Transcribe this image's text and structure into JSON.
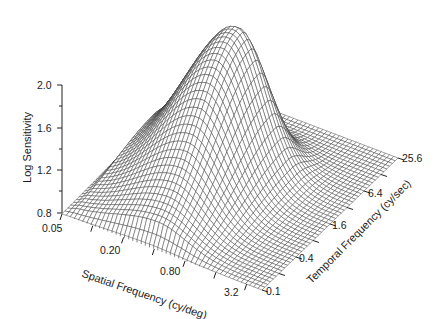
{
  "chart_data": {
    "type": "surface3d",
    "title": "",
    "zlabel": "Log Sensitivity",
    "xlabel": "Spatial Frequency (cy/deg)",
    "ylabel": "Temporal Frequency (cy/sec)",
    "z_ticks": [
      "0.8",
      "1.2",
      "1.6",
      "2.0"
    ],
    "z_range": [
      0.8,
      2.0
    ],
    "x_ticks": [
      "0.05",
      "0.20",
      "0.80",
      "3.2"
    ],
    "x_range_log": [
      0.05,
      6.4
    ],
    "y_ticks": [
      "0.1",
      "0.4",
      "1.6",
      "6.4",
      "25.6"
    ],
    "y_range_log": [
      0.1,
      25.6
    ],
    "grid": true,
    "legend": null,
    "surface_description": "Band-pass spatiotemporal contrast sensitivity surface; peak log sensitivity ~2.1 near spatial 0.4-0.8 cy/deg and temporal ~6 cy/sec; falls to 0.8 floor at high spatial (>3.2) and high temporal (>25.6) frequencies.",
    "peak": {
      "spatial_cy_deg": 0.6,
      "temporal_cy_sec": 6.0,
      "log_sensitivity": 2.1
    },
    "floor": 0.8
  },
  "labels": {
    "z_axis_title": "Log Sensitivity",
    "x_axis_title": "Spatial Frequency (cy/deg)",
    "y_axis_title": "Temporal Frequency (cy/sec)",
    "z_tick_0": "0.8",
    "z_tick_1": "1.2",
    "z_tick_2": "1.6",
    "z_tick_3": "2.0",
    "x_tick_0": "0.05",
    "x_tick_1": "0.20",
    "x_tick_2": "0.80",
    "x_tick_3": "3.2",
    "y_tick_0": "0.1",
    "y_tick_1": "0.4",
    "y_tick_2": "1.6",
    "y_tick_3": "6.4",
    "y_tick_4": "25.6"
  }
}
